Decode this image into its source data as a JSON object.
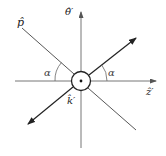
{
  "diagram": {
    "labels": {
      "p_hat": "p̂",
      "theta_hat": "θ̂′",
      "z_hat": "ẑ′",
      "k_hat": "k̂′",
      "alpha_left": "α",
      "alpha_right": "α"
    },
    "colors": {
      "line": "#333333",
      "axis": "#666666",
      "background": "#ffffff"
    },
    "elements": [
      "vertical axis with arrow (θ̂′)",
      "horizontal axis with arrow (ẑ′)",
      "line toward upper-left labeled p̂",
      "arrow toward upper-right",
      "arrow toward lower-left",
      "line toward lower-right",
      "central circle with dot (k̂′ out of page)",
      "angle arcs labeled α on both sides"
    ]
  }
}
